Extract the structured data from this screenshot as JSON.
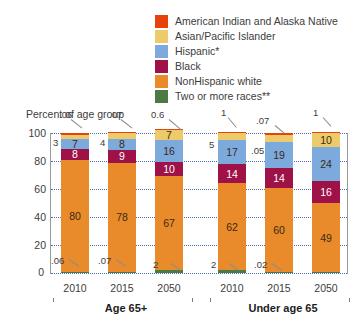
{
  "legend": {
    "items": [
      {
        "label": "American Indian and Alaska Native",
        "color": "#E8420C",
        "key": "american_indian"
      },
      {
        "label": "Asian/Pacific Islander",
        "color": "#EDCB6A",
        "key": "asian_pacific"
      },
      {
        "label": "Hispanic*",
        "color": "#7CAADC",
        "key": "hispanic"
      },
      {
        "label": "Black",
        "color": "#9E1247",
        "key": "black"
      },
      {
        "label": "NonHispanic white",
        "color": "#E98A2B",
        "key": "nonhispanic_white"
      },
      {
        "label": "Two or more races**",
        "color": "#4B7A43",
        "key": "two_or_more"
      }
    ]
  },
  "axis_title": "Percent of age group",
  "groups": [
    {
      "label": "Age 65+",
      "years": [
        "2010",
        "2015",
        "2050"
      ]
    },
    {
      "label": "Under age 65",
      "years": [
        "2010",
        "2015",
        "2050"
      ]
    }
  ],
  "chart_data": {
    "type": "bar",
    "stacked": true,
    "title": "",
    "xlabel": "",
    "ylabel": "Percent of age group",
    "ylim": [
      0,
      100
    ],
    "yticks": [
      0,
      20,
      40,
      60,
      80,
      100
    ],
    "grid": true,
    "legend_position": "top-right",
    "categories": [
      "Age 65+ 2010",
      "Age 65+ 2015",
      "Age 65+ 2050",
      "Under age 65 2010",
      "Under age 65 2015",
      "Under age 65 2050"
    ],
    "series": [
      {
        "name": "NonHispanic white",
        "color": "#E98A2B",
        "values": [
          80,
          78,
          67,
          62,
          60,
          49
        ],
        "labels": [
          "80",
          "78",
          "67",
          "62",
          "60",
          "49"
        ]
      },
      {
        "name": "Black",
        "color": "#9E1247",
        "values": [
          8,
          9,
          10,
          14,
          14,
          16
        ],
        "labels": [
          "8",
          "9",
          "10",
          "14",
          "14",
          "16"
        ]
      },
      {
        "name": "Hispanic*",
        "color": "#7CAADC",
        "values": [
          7,
          8,
          16,
          17,
          19,
          24
        ],
        "labels": [
          "7",
          "8",
          "16",
          "17",
          "19",
          "24"
        ]
      },
      {
        "name": "Asian/Pacific Islander",
        "color": "#EDCB6A",
        "values": [
          3,
          4,
          7,
          5,
          5,
          10
        ],
        "labels": [
          "3",
          "4",
          "7",
          "5",
          "5",
          "10"
        ]
      },
      {
        "name": "American Indian and Alaska Native",
        "color": "#E8420C",
        "values": [
          0.6,
          0.7,
          0.6,
          1,
          0.7,
          1
        ],
        "labels": [
          ".06",
          ".07",
          "0.6",
          "1",
          ".07",
          "1"
        ]
      },
      {
        "name": "Two or more races**",
        "color": "#4B7A43",
        "values": [
          0.6,
          0.7,
          2,
          2,
          0.2,
          0.5
        ],
        "labels": [
          ".06",
          ".07",
          "2",
          "2",
          ".02",
          ""
        ]
      }
    ],
    "top_callouts": [
      {
        "bar": 0,
        "text": ".06"
      },
      {
        "bar": 1,
        "text": ".07"
      },
      {
        "bar": 2,
        "text": "0.6"
      },
      {
        "bar": 3,
        "text": "1"
      },
      {
        "bar": 4,
        "text": ".07"
      },
      {
        "bar": 5,
        "text": "1"
      }
    ],
    "inner_top_labels": [
      {
        "bar": 0,
        "text": "3"
      },
      {
        "bar": 1,
        "text": "4"
      },
      {
        "bar": 3,
        "text": "5"
      },
      {
        "bar": 4,
        "text": ".05"
      }
    ],
    "bottom_callouts": [
      {
        "bar": 0,
        "text": ".06"
      },
      {
        "bar": 1,
        "text": ".07"
      },
      {
        "bar": 2,
        "text": "2"
      },
      {
        "bar": 3,
        "text": "2"
      },
      {
        "bar": 4,
        "text": ".02"
      }
    ]
  }
}
